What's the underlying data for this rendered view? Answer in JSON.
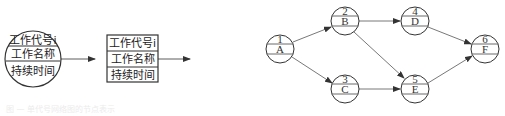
{
  "legend": {
    "circle_node": {
      "rows": [
        "工作代号i",
        "工作名称",
        "持续时间"
      ]
    },
    "box_node": {
      "rows": [
        "工作代号i",
        "工作名称",
        "持续时间"
      ]
    }
  },
  "network": {
    "nodes": [
      {
        "id": "1",
        "name": "A",
        "x": 280,
        "y": 49
      },
      {
        "id": "2",
        "name": "B",
        "x": 345,
        "y": 21
      },
      {
        "id": "3",
        "name": "C",
        "x": 345,
        "y": 89
      },
      {
        "id": "4",
        "name": "D",
        "x": 415,
        "y": 21
      },
      {
        "id": "5",
        "name": "E",
        "x": 415,
        "y": 89
      },
      {
        "id": "6",
        "name": "F",
        "x": 485,
        "y": 49
      }
    ],
    "edges": [
      {
        "from": "1",
        "to": "2"
      },
      {
        "from": "1",
        "to": "3"
      },
      {
        "from": "2",
        "to": "4"
      },
      {
        "from": "2",
        "to": "5"
      },
      {
        "from": "3",
        "to": "5"
      },
      {
        "from": "4",
        "to": "6"
      },
      {
        "from": "5",
        "to": "6"
      }
    ]
  },
  "caption": "图 — 单代号网络图的节点表示"
}
